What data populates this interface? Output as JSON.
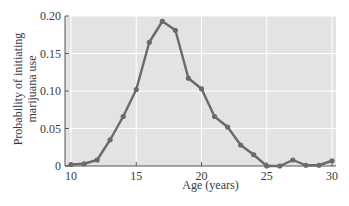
{
  "chart_data": {
    "type": "line",
    "title": "",
    "xlabel": "Age (years)",
    "ylabel": "Probability of initiating marijuana use",
    "ylabel_lines": [
      "Probability of initiating",
      "marijuana use"
    ],
    "xlim": [
      10,
      30
    ],
    "ylim": [
      0,
      0.2
    ],
    "xticks": [
      10,
      15,
      20,
      25,
      30
    ],
    "xtick_labels": [
      "10",
      "15",
      "20",
      "25",
      "30"
    ],
    "yticks": [
      0,
      0.05,
      0.1,
      0.15,
      0.2
    ],
    "ytick_labels": [
      "0",
      "0.05",
      "0.10",
      "0.15",
      "0.20"
    ],
    "grid": true,
    "legend": null,
    "x": [
      10,
      11,
      12,
      13,
      14,
      15,
      16,
      17,
      18,
      19,
      20,
      21,
      22,
      23,
      24,
      25,
      26,
      27,
      28,
      29,
      30
    ],
    "series": [
      {
        "name": "Probability of initiating marijuana use",
        "values": [
          0.002,
          0.003,
          0.008,
          0.035,
          0.066,
          0.102,
          0.165,
          0.193,
          0.181,
          0.117,
          0.103,
          0.066,
          0.052,
          0.028,
          0.015,
          0.0,
          0.0,
          0.008,
          0.001,
          0.001,
          0.007
        ]
      }
    ],
    "colors": {
      "plot_background": "#e3e3e3",
      "grid": "#ffffff",
      "line": "#6a6a6a",
      "axis": "#555555"
    }
  }
}
